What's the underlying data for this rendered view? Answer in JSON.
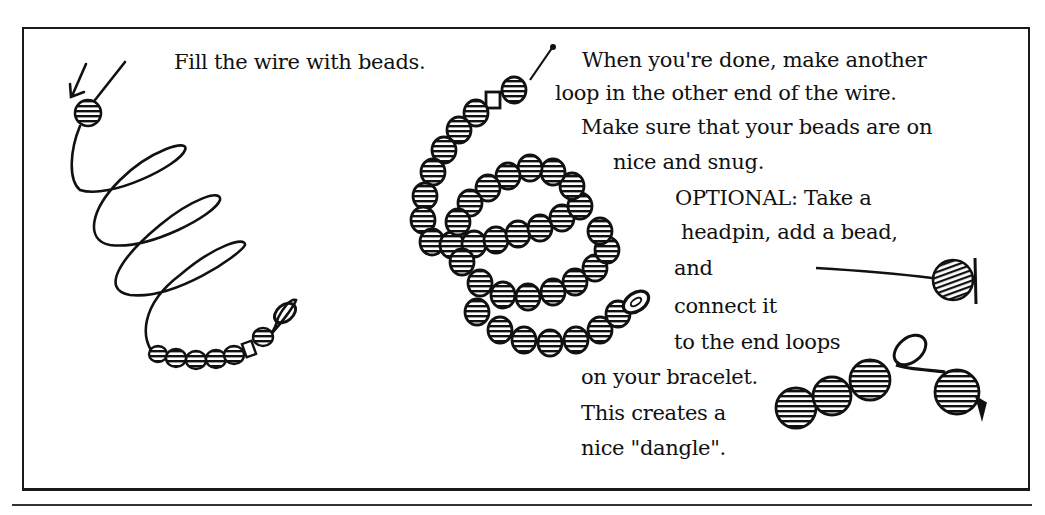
{
  "instructions": {
    "step_fill": "Fill the wire with beads.",
    "step_loop": [
      "When you're done, make another",
      "loop in the other end of the wire.",
      "Make sure that your beads are on",
      "nice and snug."
    ],
    "optional": [
      "OPTIONAL: Take a",
      "headpin, add a bead,",
      "and",
      "connect it",
      "to the end loops",
      "on your bracelet.",
      "This creates a",
      "nice \"dangle\"."
    ]
  },
  "illustrations": [
    {
      "name": "wire-coil-with-first-bead",
      "description": "Coiled wire with an arrow pointing to a bead on the top end and a few beads near the loop at the bottom"
    },
    {
      "name": "beaded-coil-bracelet",
      "description": "Memory-wire coil fully filled with striped beads"
    },
    {
      "name": "headpin-with-bead",
      "description": "Headpin with a single striped bead"
    },
    {
      "name": "dangle-on-bracelet-end",
      "description": "Bracelet end loop with the headpin dangle attached"
    }
  ]
}
